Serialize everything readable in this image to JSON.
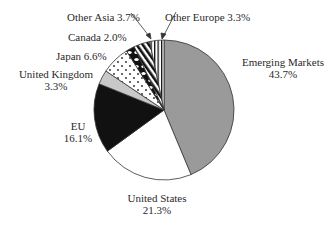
{
  "chart_data": {
    "type": "pie",
    "title": "",
    "start_angle_deg": 0,
    "direction": "clockwise",
    "slices": [
      {
        "label": "Emerging Markets",
        "value": 43.7,
        "pct_text": "43.7%",
        "fill": "gray"
      },
      {
        "label": "United States",
        "value": 21.3,
        "pct_text": "21.3%",
        "fill": "white"
      },
      {
        "label": "EU",
        "value": 16.1,
        "pct_text": "16.1%",
        "fill": "black"
      },
      {
        "label": "United Kingdom",
        "value": 3.3,
        "pct_text": "3.3%",
        "fill": "light-gray"
      },
      {
        "label": "Japan",
        "value": 6.6,
        "pct_text": "6.6%",
        "fill": "dotted"
      },
      {
        "label": "Canada",
        "value": 2.0,
        "pct_text": "2.0%",
        "fill": "black-white-blotch"
      },
      {
        "label": "Other Asia",
        "value": 3.7,
        "pct_text": "3.7%",
        "fill": "diagonal-stripes"
      },
      {
        "label": "Other Europe",
        "value": 3.3,
        "pct_text": "3.3%",
        "fill": "vertical-stripes"
      }
    ]
  },
  "labels": {
    "emerging_markets": {
      "name": "Emerging Markets",
      "pct": "43.7%"
    },
    "united_states": {
      "name": "United States",
      "pct": "21.3%"
    },
    "eu": {
      "name": "EU",
      "pct": "16.1%"
    },
    "united_kingdom": {
      "name": "United Kingdom",
      "pct": "3.3%"
    },
    "japan": "Japan 6.6%",
    "canada": "Canada 2.0%",
    "other_asia": "Other Asia 3.7%",
    "other_europe": "Other Europe 3.3%"
  },
  "colors": {
    "gray": "#9a9a9a",
    "light_gray": "#c8c8c8",
    "black": "#111111",
    "white": "#ffffff",
    "outline": "#333333"
  }
}
